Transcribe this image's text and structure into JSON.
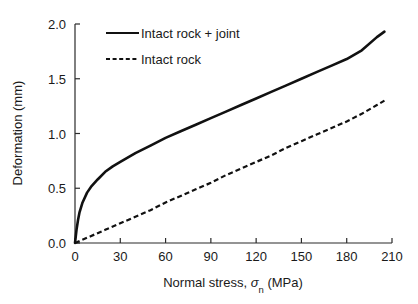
{
  "chart_data": {
    "type": "line",
    "title": "",
    "xlabel": "Normal stress, σn (MPa)",
    "xlabel_parts": {
      "prefix": "Normal stress, ",
      "symbol": "σ",
      "subscript": "n",
      "suffix": " (MPa)"
    },
    "ylabel": "Deformation (mm)",
    "xlim": [
      0,
      210
    ],
    "ylim": [
      0.0,
      2.0
    ],
    "xticks": [
      0,
      30,
      60,
      90,
      120,
      150,
      180,
      210
    ],
    "xtick_labels": [
      "0",
      "30",
      "60",
      "90",
      "120",
      "150",
      "180",
      "210"
    ],
    "yticks": [
      0.0,
      0.5,
      1.0,
      1.5,
      2.0
    ],
    "ytick_labels": [
      "0.0",
      "0.5",
      "1.0",
      "1.5",
      "2.0"
    ],
    "grid": false,
    "legend_position": "upper-left-inside",
    "series": [
      {
        "name": "Intact rock + joint",
        "style": "solid",
        "color": "#111111",
        "x": [
          0,
          1,
          2,
          3,
          5,
          8,
          11,
          15,
          20,
          25,
          30,
          40,
          50,
          60,
          70,
          80,
          90,
          100,
          110,
          120,
          130,
          140,
          150,
          160,
          170,
          180,
          190,
          200,
          205
        ],
        "y": [
          0.0,
          0.12,
          0.21,
          0.28,
          0.37,
          0.46,
          0.52,
          0.58,
          0.65,
          0.7,
          0.74,
          0.82,
          0.89,
          0.96,
          1.02,
          1.08,
          1.14,
          1.2,
          1.26,
          1.32,
          1.38,
          1.44,
          1.5,
          1.56,
          1.62,
          1.68,
          1.76,
          1.88,
          1.93
        ]
      },
      {
        "name": "Intact rock",
        "style": "dashed",
        "color": "#111111",
        "x": [
          0,
          10,
          20,
          30,
          40,
          50,
          60,
          70,
          80,
          90,
          100,
          110,
          120,
          130,
          140,
          150,
          160,
          170,
          180,
          190,
          200,
          205
        ],
        "y": [
          0.0,
          0.06,
          0.12,
          0.18,
          0.24,
          0.3,
          0.37,
          0.43,
          0.49,
          0.55,
          0.62,
          0.68,
          0.74,
          0.8,
          0.87,
          0.93,
          0.99,
          1.05,
          1.11,
          1.18,
          1.26,
          1.3
        ]
      }
    ]
  },
  "legend": {
    "entries": [
      {
        "label": "Intact rock + joint",
        "style": "solid"
      },
      {
        "label": "Intact rock",
        "style": "dashed"
      }
    ]
  },
  "colors": {
    "axis": "#2b2b2b",
    "series": "#111111",
    "background": "#ffffff"
  }
}
